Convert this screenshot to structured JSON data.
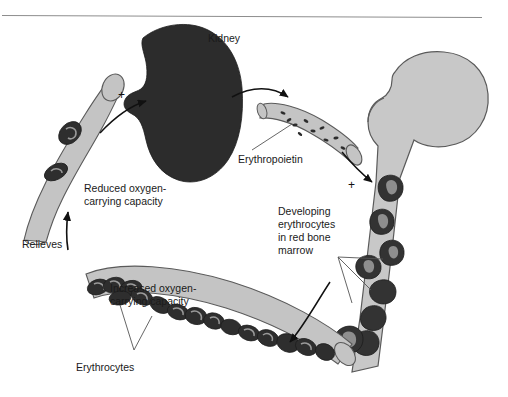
{
  "figure": {
    "title_rule": "horizontal-rule",
    "background_color": "#ffffff",
    "colors": {
      "kidney_fill": "#2c2c2c",
      "vessel_fill": "#c4c4c4",
      "bone_fill": "#c8c8c8",
      "erythrocyte_fill": "#2e2e2e",
      "developing_cell_fill": "#333333",
      "outline": "#555555",
      "text": "#1a1a1a",
      "arrow": "#111111"
    }
  },
  "labels": {
    "kidney": "Kidney",
    "erythropoietin": "Erythropoietin",
    "reduced_capacity_line1": "Reduced oxygen-",
    "reduced_capacity_line2": "carrying capacity",
    "relieves": "Relieves",
    "increased_capacity_line1": "Increased oxygen-",
    "increased_capacity_line2": "carrying capacity",
    "erythrocytes": "Erythrocytes",
    "developing_line1": "Developing",
    "developing_line2": "erythrocytes",
    "developing_line3": "in red bone",
    "developing_line4": "marrow",
    "plus_left": "+",
    "plus_right": "+"
  }
}
